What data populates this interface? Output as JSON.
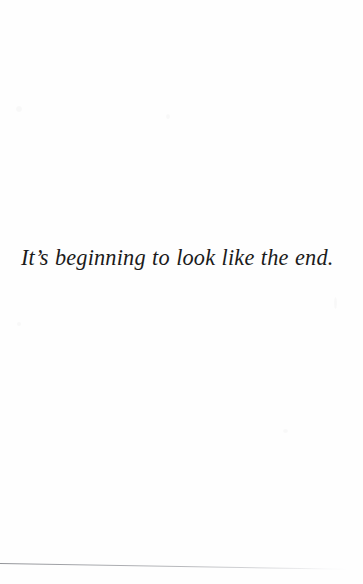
{
  "page": {
    "background_color": "#ffffff",
    "width": 363,
    "height": 584
  },
  "content": {
    "quote": "It’s beginning to look like the end.",
    "text_color": "#1b1b1b",
    "style": "italic-serif",
    "alignment": "left"
  },
  "artifacts": {
    "scan_line_color": "#7a7c80",
    "scan_line_label": "page-edge-scan-line"
  }
}
